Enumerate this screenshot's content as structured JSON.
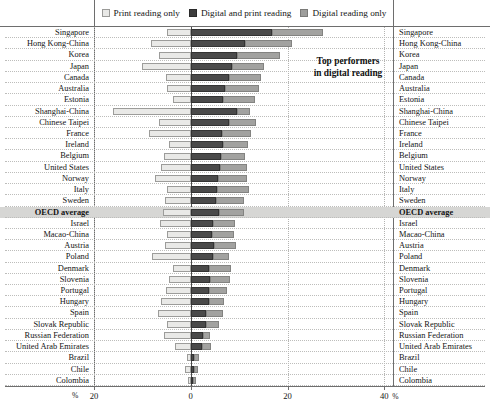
{
  "legend": {
    "items": [
      {
        "key": "print_only",
        "label": "Print reading only",
        "color": "#e9e9e7"
      },
      {
        "key": "digital_and_print",
        "label": "Digital and print reading",
        "color": "#4a4a4a"
      },
      {
        "key": "digital_only",
        "label": "Digital reading only",
        "color": "#a2a2a0"
      }
    ]
  },
  "annotation": {
    "line1": "Top performers",
    "line2": "in digital reading"
  },
  "axis": {
    "percent_symbol_left": "%",
    "percent_symbol_right": "%",
    "ticks": [
      {
        "label": "20",
        "value": -20
      },
      {
        "label": "0",
        "value": 0
      },
      {
        "label": "20",
        "value": 20
      },
      {
        "label": "40",
        "value": 40
      }
    ],
    "xmin": -20,
    "xmax": 42,
    "gridlines": [
      -20,
      20,
      40
    ]
  },
  "chart_data": {
    "type": "bar",
    "title": "",
    "subtitle": "",
    "xlabel": "%",
    "ylabel": "",
    "orientation": "horizontal",
    "stacked": true,
    "diverging": true,
    "xlim": [
      -20,
      42
    ],
    "grid": true,
    "legend_position": "top",
    "series": [
      {
        "name": "Print reading only",
        "color": "#e9e9e7",
        "direction": "negative"
      },
      {
        "name": "Digital and print reading",
        "color": "#4a4a4a",
        "direction": "positive"
      },
      {
        "name": "Digital reading only",
        "color": "#a2a2a0",
        "direction": "positive"
      }
    ],
    "categories": [
      "Singapore",
      "Hong Kong-China",
      "Korea",
      "Japan",
      "Canada",
      "Australia",
      "Estonia",
      "Shanghai-China",
      "Chinese Taipei",
      "France",
      "Ireland",
      "United States",
      "Belgium",
      "Norway",
      "Italy",
      "Sweden",
      "OECD average",
      "Israel",
      "Macao-China",
      "Austria",
      "Poland",
      "Denmark",
      "Slovenia",
      "Portugal",
      "Hungary",
      "Spain",
      "Slovak Republic",
      "Russian Federation",
      "United Arab Emirates",
      "Brazil",
      "Chile",
      "Colombia"
    ],
    "highlight_category": "OECD average",
    "top_performers": [
      "Singapore",
      "Hong Kong-China",
      "Korea",
      "Japan",
      "Canada",
      "Australia",
      "Estonia"
    ],
    "rows": [
      {
        "category": "Singapore",
        "print_only": 5.0,
        "digital_and_print": 16.8,
        "digital_only": 10.5
      },
      {
        "category": "Hong Kong-China",
        "print_only": 8.2,
        "digital_and_print": 11.2,
        "digital_only": 9.8
      },
      {
        "category": "Korea",
        "print_only": 6.5,
        "digital_and_print": 9.5,
        "digital_only": 9.0
      },
      {
        "category": "Japan",
        "print_only": 10.0,
        "digital_and_print": 8.6,
        "digital_only": 6.5
      },
      {
        "category": "Canada",
        "print_only": 5.2,
        "digital_and_print": 7.8,
        "digital_only": 6.8
      },
      {
        "category": "Australia",
        "print_only": 5.0,
        "digital_and_print": 7.0,
        "digital_only": 7.2
      },
      {
        "category": "Estonia",
        "print_only": 3.6,
        "digital_and_print": 6.6,
        "digital_only": 6.6
      },
      {
        "category": "Shanghai-China",
        "print_only": 16.0,
        "digital_and_print": 9.6,
        "digital_only": 2.6
      },
      {
        "category": "Chinese Taipei",
        "print_only": 6.6,
        "digital_and_print": 8.0,
        "digital_only": 5.4
      },
      {
        "category": "France",
        "print_only": 8.6,
        "digital_and_print": 6.4,
        "digital_only": 6.0
      },
      {
        "category": "Ireland",
        "print_only": 4.4,
        "digital_and_print": 6.6,
        "digital_only": 5.2
      },
      {
        "category": "Belgium",
        "print_only": 5.6,
        "digital_and_print": 6.2,
        "digital_only": 5.0
      },
      {
        "category": "United States",
        "print_only": 6.2,
        "digital_and_print": 6.0,
        "digital_only": 5.6
      },
      {
        "category": "Norway",
        "print_only": 7.4,
        "digital_and_print": 5.6,
        "digital_only": 6.0
      },
      {
        "category": "Italy",
        "print_only": 5.0,
        "digital_and_print": 5.4,
        "digital_only": 6.6
      },
      {
        "category": "Sweden",
        "print_only": 5.4,
        "digital_and_print": 5.2,
        "digital_only": 5.8
      },
      {
        "category": "OECD average",
        "print_only": 5.8,
        "digital_and_print": 5.8,
        "digital_only": 5.2
      },
      {
        "category": "Israel",
        "print_only": 6.4,
        "digital_and_print": 4.6,
        "digital_only": 4.6
      },
      {
        "category": "Macao-China",
        "print_only": 5.0,
        "digital_and_print": 4.4,
        "digital_only": 4.6
      },
      {
        "category": "Austria",
        "print_only": 5.4,
        "digital_and_print": 4.8,
        "digital_only": 4.6
      },
      {
        "category": "Poland",
        "print_only": 8.0,
        "digital_and_print": 4.6,
        "digital_only": 3.4
      },
      {
        "category": "Denmark",
        "print_only": 3.6,
        "digital_and_print": 3.8,
        "digital_only": 4.6
      },
      {
        "category": "Slovenia",
        "print_only": 4.6,
        "digital_and_print": 4.0,
        "digital_only": 4.2
      },
      {
        "category": "Portugal",
        "print_only": 5.2,
        "digital_and_print": 3.8,
        "digital_only": 3.6
      },
      {
        "category": "Hungary",
        "print_only": 6.2,
        "digital_and_print": 3.8,
        "digital_only": 3.0
      },
      {
        "category": "Spain",
        "print_only": 6.8,
        "digital_and_print": 3.2,
        "digital_only": 3.4
      },
      {
        "category": "Slovak Republic",
        "print_only": 5.0,
        "digital_and_print": 3.2,
        "digital_only": 2.6
      },
      {
        "category": "Russian Federation",
        "print_only": 5.6,
        "digital_and_print": 2.6,
        "digital_only": 1.4
      },
      {
        "category": "United Arab Emirates",
        "print_only": 3.2,
        "digital_and_print": 2.4,
        "digital_only": 1.8
      },
      {
        "category": "Brazil",
        "print_only": 0.8,
        "digital_and_print": 0.6,
        "digital_only": 1.2
      },
      {
        "category": "Chile",
        "print_only": 1.2,
        "digital_and_print": 0.6,
        "digital_only": 0.8
      },
      {
        "category": "Colombia",
        "print_only": 0.5,
        "digital_and_print": 0.5,
        "digital_only": 0.5
      }
    ]
  }
}
